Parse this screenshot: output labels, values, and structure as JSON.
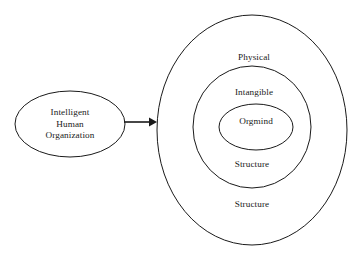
{
  "diagram": {
    "background_color": "#ffffff",
    "stroke_color": "#1a1a1a",
    "source_node": {
      "label_line1": "Intelligent",
      "label_line2": "Human",
      "label_line3": "Organization",
      "shape": "ellipse",
      "center_x": 70,
      "center_y": 124,
      "radius_x": 55,
      "radius_y": 33
    },
    "connector": {
      "icon": "arrow-right-icon",
      "from_x": 124,
      "from_y": 122,
      "to_x": 156,
      "to_y": 122
    },
    "nested_rings": [
      {
        "id": "outer",
        "label": "Structure",
        "label_x": 252,
        "label_y": 205,
        "shape": "ellipse",
        "center_x": 252,
        "center_y": 130,
        "radius_x": 95,
        "radius_y": 115
      },
      {
        "id": "middle",
        "label": "Structure",
        "label_x": 252,
        "label_y": 165,
        "shape": "ellipse",
        "center_x": 252,
        "center_y": 127,
        "radius_x": 59,
        "radius_y": 61
      },
      {
        "id": "inner",
        "label": "Orgmind",
        "label_x": 256,
        "label_y": 122,
        "shape": "ellipse",
        "center_x": 256,
        "center_y": 127,
        "radius_x": 37,
        "radius_y": 23
      }
    ],
    "ring_captions": [
      {
        "id": "physical",
        "label": "Physical",
        "label_x": 254,
        "label_y": 58
      },
      {
        "id": "intangible",
        "label": "Intangible",
        "label_x": 254,
        "label_y": 93
      }
    ]
  }
}
